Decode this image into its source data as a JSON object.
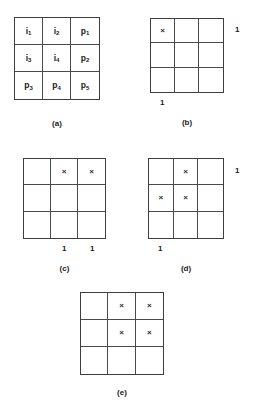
{
  "figure": {
    "background_color": "#ffffff",
    "line_color": "#4a4a4a",
    "text_color": "#1a1a1a",
    "mark_symbol": "×",
    "one_label": "1",
    "panels": [
      {
        "id": "a",
        "caption": "(a)",
        "cells": [
          {
            "base": "i",
            "sub": "1"
          },
          {
            "base": "i",
            "sub": "2"
          },
          {
            "base": "p",
            "sub": "1"
          },
          {
            "base": "i",
            "sub": "3"
          },
          {
            "base": "i",
            "sub": "4"
          },
          {
            "base": "p",
            "sub": "2"
          },
          {
            "base": "p",
            "sub": "3"
          },
          {
            "base": "p",
            "sub": "4"
          },
          {
            "base": "p",
            "sub": "5"
          }
        ],
        "marks": [],
        "row_labels": [],
        "column_labels": []
      },
      {
        "id": "b",
        "caption": "(b)",
        "cells": [],
        "marks": [
          [
            1,
            1
          ]
        ],
        "row_labels": [
          {
            "row": 1,
            "text": "1"
          }
        ],
        "column_labels": [
          {
            "column": 1,
            "text": "1"
          }
        ]
      },
      {
        "id": "c",
        "caption": "(c)",
        "cells": [],
        "marks": [
          [
            1,
            2
          ],
          [
            1,
            3
          ]
        ],
        "row_labels": [],
        "column_labels": [
          {
            "column": 2,
            "text": "1"
          },
          {
            "column": 3,
            "text": "1"
          }
        ]
      },
      {
        "id": "d",
        "caption": "(d)",
        "cells": [],
        "marks": [
          [
            1,
            2
          ],
          [
            2,
            1
          ],
          [
            2,
            2
          ]
        ],
        "row_labels": [
          {
            "row": 1,
            "text": "1"
          }
        ],
        "column_labels": [
          {
            "column": 1,
            "text": "1"
          }
        ]
      },
      {
        "id": "e",
        "caption": "(e)",
        "cells": [],
        "marks": [
          [
            1,
            2
          ],
          [
            1,
            3
          ],
          [
            2,
            2
          ],
          [
            2,
            3
          ]
        ],
        "row_labels": [],
        "column_labels": []
      }
    ]
  }
}
